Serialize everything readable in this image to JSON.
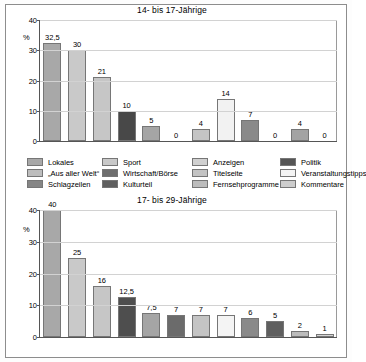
{
  "legend": {
    "items": [
      {
        "label": "Lokales",
        "color": "#a8a8a8"
      },
      {
        "label": "Sport",
        "color": "#c9c9c9"
      },
      {
        "label": "Anzeigen",
        "color": "#d0d0d0"
      },
      {
        "label": "Politik",
        "color": "#555555"
      },
      {
        "label": "„Aus aller Welt“",
        "color": "#bdbdbd"
      },
      {
        "label": "Wirtschaft/Börse",
        "color": "#6e6e6e"
      },
      {
        "label": "Titelseite",
        "color": "#c4c4c4"
      },
      {
        "label": "Veranstaltungstipps",
        "color": "#f4f4f4"
      },
      {
        "label": "Schlagzeilen",
        "color": "#858585"
      },
      {
        "label": "Kulturteil",
        "color": "#5f5f5f"
      },
      {
        "label": "Fernsehprogramme",
        "color": "#bcbcbc"
      },
      {
        "label": "Kommentare",
        "color": "#cdcdcd"
      }
    ]
  },
  "chart_data": [
    {
      "type": "bar",
      "title": "14- bis 17-Jährige",
      "xlabel": "",
      "ylabel": "%",
      "ylim": [
        0,
        40
      ],
      "yticks": [
        0,
        10,
        20,
        30,
        40
      ],
      "grid": true,
      "legend_position": "between-charts",
      "categories": [
        "Lokales",
        "Sport",
        "Anzeigen",
        "Politik",
        "„Aus aller Welt“",
        "Wirtschaft/Börse",
        "Titelseite",
        "Veranstaltungstipps",
        "Schlagzeilen",
        "Kulturteil",
        "Fernsehprogramme",
        "Kommentare"
      ],
      "values": [
        32.5,
        30,
        21,
        10,
        5,
        0,
        4,
        14,
        7,
        0,
        4,
        0
      ],
      "value_labels": [
        "32,5",
        "30",
        "21",
        "10",
        "5",
        "0",
        "4",
        "14",
        "7",
        "0",
        "4",
        "0"
      ],
      "colors": [
        "#a8a8a8",
        "#c9c9c9",
        "#c6c6c6",
        "#484848",
        "#a5a5a5",
        "#ffffff",
        "#c4c4c4",
        "#f2f2f2",
        "#8a8a8a",
        "#ffffff",
        "#a3a3a3",
        "#ffffff"
      ]
    },
    {
      "type": "bar",
      "title": "17- bis 29-Jährige",
      "xlabel": "",
      "ylabel": "%",
      "ylim": [
        0,
        40
      ],
      "yticks": [
        0,
        10,
        20,
        30,
        40
      ],
      "grid": true,
      "categories": [
        "Lokales",
        "Sport",
        "Anzeigen",
        "Politik",
        "„Aus aller Welt“",
        "Wirtschaft/Börse",
        "Titelseite",
        "Veranstaltungstipps",
        "Schlagzeilen",
        "Kulturteil",
        "Fernsehprogramme",
        "Kommentare"
      ],
      "values": [
        40,
        25,
        16,
        12.5,
        7.5,
        7,
        7,
        7,
        6,
        5,
        2,
        1
      ],
      "value_labels": [
        "40",
        "25",
        "16",
        "12,5",
        "7,5",
        "7",
        "7",
        "7",
        "6",
        "5",
        "2",
        "1"
      ],
      "colors": [
        "#a8a8a8",
        "#c9c9c9",
        "#c6c6c6",
        "#4e4e4e",
        "#a5a5a5",
        "#6b6b6b",
        "#c4c4c4",
        "#f4f4f4",
        "#8a8a8a",
        "#5f5f5f",
        "#bcbcbc",
        "#d4d4d4"
      ]
    }
  ]
}
